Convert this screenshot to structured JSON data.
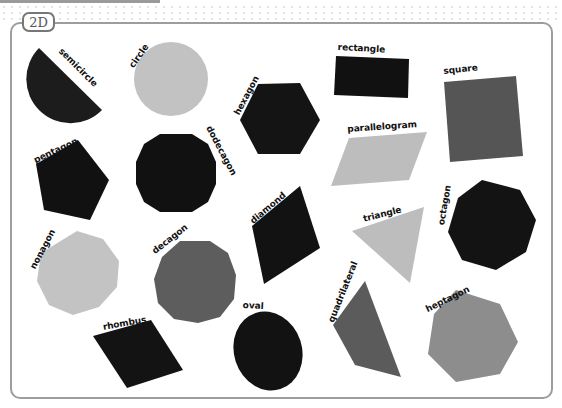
{
  "header": {
    "tag": "2D"
  },
  "colors": {
    "black": "#131313",
    "dark_gray": "#5a5a5a",
    "mid_gray": "#8f8f8f",
    "light_gray": "#c4c4c4",
    "border": "#9d9d9d"
  },
  "shapes": [
    {
      "name": "semicircle",
      "label": "semicircle",
      "fill": "black"
    },
    {
      "name": "circle",
      "label": "circle",
      "fill": "light_gray"
    },
    {
      "name": "hexagon",
      "label": "hexagon",
      "fill": "black"
    },
    {
      "name": "rectangle",
      "label": "rectangle",
      "fill": "black"
    },
    {
      "name": "square",
      "label": "square",
      "fill": "dark_gray"
    },
    {
      "name": "pentagon",
      "label": "pentagon",
      "fill": "black"
    },
    {
      "name": "dodecagon",
      "label": "dodecagon",
      "fill": "black"
    },
    {
      "name": "parallelogram",
      "label": "parallelogram",
      "fill": "light_gray"
    },
    {
      "name": "diamond",
      "label": "diamond",
      "fill": "black"
    },
    {
      "name": "triangle",
      "label": "triangle",
      "fill": "light_gray"
    },
    {
      "name": "octagon",
      "label": "octagon",
      "fill": "black"
    },
    {
      "name": "nonagon",
      "label": "nonagon",
      "fill": "light_gray"
    },
    {
      "name": "decagon",
      "label": "decagon",
      "fill": "dark_gray"
    },
    {
      "name": "rhombus",
      "label": "rhombus",
      "fill": "black"
    },
    {
      "name": "oval",
      "label": "oval",
      "fill": "black"
    },
    {
      "name": "quadrilateral",
      "label": "quadrilateral",
      "fill": "dark_gray"
    },
    {
      "name": "heptagon",
      "label": "heptagon",
      "fill": "mid_gray"
    }
  ]
}
